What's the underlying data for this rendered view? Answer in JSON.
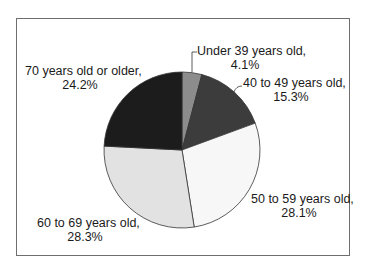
{
  "chart_data": {
    "type": "pie",
    "title": "",
    "categories": [
      "Under 39 years old",
      "40 to 49 years old",
      "50 to 59 years old",
      "60 to 69 years old",
      "70 years old or older"
    ],
    "values": [
      4.1,
      15.3,
      28.1,
      28.3,
      24.2
    ],
    "unit": "%",
    "colors": [
      "#8c8c8c",
      "#3c3c3c",
      "#f7f7f7",
      "#e2e2e2",
      "#1c1c1c"
    ],
    "labels": [
      {
        "name": "Under 39 years old,",
        "value": "4.1%"
      },
      {
        "name": "40 to 49 years old,",
        "value": "15.3%"
      },
      {
        "name": "50 to 59 years old,",
        "value": "28.1%"
      },
      {
        "name": "60 to 69 years old,",
        "value": "28.3%"
      },
      {
        "name": "70 years old or older,",
        "value": "24.2%"
      }
    ],
    "legend": "none (data labels)",
    "start_angle": "12 o'clock, clockwise"
  }
}
